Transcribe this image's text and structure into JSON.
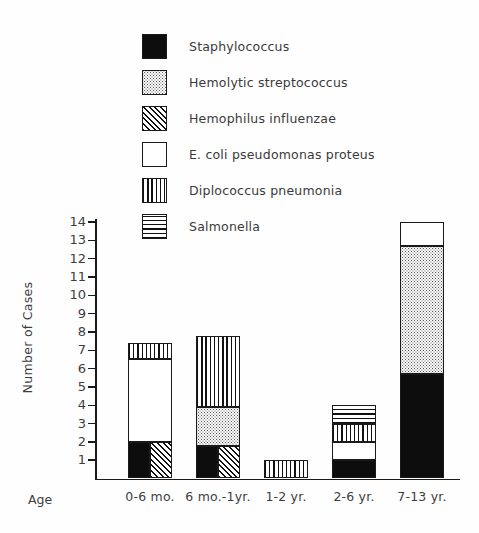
{
  "chart_data": {
    "type": "bar",
    "title": "",
    "subtitle": "",
    "xlabel": "Age",
    "ylabel": "Number of Cases",
    "ylim": [
      0,
      14
    ],
    "ytick_labels": [
      "1",
      "2",
      "3",
      "4",
      "5",
      "6",
      "7",
      "8",
      "9",
      "10",
      "11",
      "12",
      "13",
      "14"
    ],
    "yticks": [
      1,
      2,
      3,
      4,
      5,
      6,
      7,
      8,
      9,
      10,
      11,
      12,
      13,
      14
    ],
    "grid": false,
    "legend_position": "top-left",
    "stacked": true,
    "categories": [
      "0-6 mo.",
      "6 mo.-1yr.",
      "1-2 yr.",
      "2-6 yr.",
      "7-13 yr."
    ],
    "series": [
      {
        "name": "Staphylococcus",
        "pattern": "solid-black",
        "values": [
          2,
          1.8,
          0,
          1,
          5.7
        ]
      },
      {
        "name": "Hemolytic streptococcus",
        "pattern": "stipple",
        "values": [
          0,
          2.1,
          0,
          0,
          7.0
        ]
      },
      {
        "name": "Hemophilus influenzae",
        "pattern": "diagonal-hatch",
        "values": [
          2,
          1.8,
          0,
          0,
          0
        ]
      },
      {
        "name": "E. coli pseudomonas proteus",
        "pattern": "white",
        "values": [
          4.5,
          0,
          0,
          1,
          1.3
        ]
      },
      {
        "name": "Diplococcus pneumonia",
        "pattern": "vertical-lines",
        "values": [
          0.9,
          3.9,
          1,
          1,
          0
        ]
      },
      {
        "name": "Salmonella",
        "pattern": "horizontal-lines",
        "values": [
          0,
          0,
          0,
          1,
          0
        ]
      }
    ],
    "bar_totals": [
      9.0,
      7.8,
      1.0,
      4.0,
      14.0
    ]
  },
  "legend": {
    "items": [
      {
        "label": "Staphylococcus",
        "swatch": "solid-black-swatch"
      },
      {
        "label": "Hemolytic streptococcus",
        "swatch": "stipple-swatch"
      },
      {
        "label": "Hemophilus influenzae",
        "swatch": "diagonal-hatch-swatch"
      },
      {
        "label": "E. coli pseudomonas proteus",
        "swatch": "white-swatch"
      },
      {
        "label": "Diplococcus pneumonia",
        "swatch": "vertical-lines-swatch"
      },
      {
        "label": "Salmonella",
        "swatch": "horizontal-lines-swatch"
      }
    ]
  },
  "axes": {
    "y_title": "Number of Cases",
    "x_title": "Age",
    "y_ticks": [
      "14",
      "13",
      "12",
      "11",
      "10",
      "9",
      "8",
      "7",
      "6",
      "5",
      "4",
      "3",
      "2",
      "1"
    ],
    "x_categories": [
      "0-6 mo.",
      "6 mo.-1yr.",
      "1-2 yr.",
      "2-6 yr.",
      "7-13 yr."
    ]
  },
  "colors": {
    "ink": "#1a1a1a",
    "text": "#3d3d3d",
    "paper": "#fefefe",
    "fill_black": "#0d0d0d",
    "fill_white": "#ffffff"
  }
}
